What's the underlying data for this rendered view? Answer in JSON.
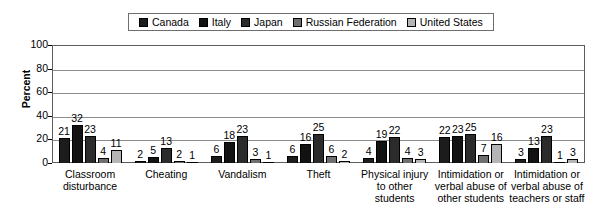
{
  "legend": {
    "entries": [
      {
        "label": "Canada",
        "color": "#1c1c1c",
        "swatch_name": "legend-swatch-canada"
      },
      {
        "label": "Italy",
        "color": "#121212",
        "swatch_name": "legend-swatch-italy"
      },
      {
        "label": "Japan",
        "color": "#2b2b2b",
        "swatch_name": "legend-swatch-japan"
      },
      {
        "label": "Russian Federation",
        "color": "#6f6f6f",
        "swatch_name": "legend-swatch-russian-federation"
      },
      {
        "label": "United States",
        "color": "#b5b5b5",
        "swatch_name": "legend-swatch-united-states"
      }
    ]
  },
  "axis": {
    "ylabel": "Percent",
    "yticks": [
      "100",
      "80",
      "60",
      "40",
      "20",
      "0"
    ]
  },
  "chart_data": {
    "type": "bar",
    "title": "",
    "xlabel": "",
    "ylabel": "Percent",
    "ylim": [
      0,
      100
    ],
    "yticks": [
      0,
      20,
      40,
      60,
      80,
      100
    ],
    "grid": true,
    "legend_position": "top-center",
    "categories": [
      "Classroom disturbance",
      "Cheating",
      "Vandalism",
      "Theft",
      "Physical injury to other students",
      "Intimidation or verbal abuse of other students",
      "Intimidation or verbal abuse of teachers or staff"
    ],
    "category_lines": [
      [
        "Classroom",
        "disturbance"
      ],
      [
        "Cheating"
      ],
      [
        "Vandalism"
      ],
      [
        "Theft"
      ],
      [
        "Physical injury",
        "to other",
        "students"
      ],
      [
        "Intimidation or",
        "verbal abuse of",
        "other students"
      ],
      [
        "Intimidation or",
        "verbal abuse of",
        "teachers or staff"
      ]
    ],
    "series": [
      {
        "name": "Canada",
        "color": "#1c1c1c",
        "values": [
          21,
          2,
          6,
          6,
          4,
          22,
          3
        ]
      },
      {
        "name": "Italy",
        "color": "#121212",
        "values": [
          32,
          5,
          18,
          16,
          19,
          23,
          13
        ]
      },
      {
        "name": "Japan",
        "color": "#2b2b2b",
        "values": [
          23,
          13,
          23,
          25,
          22,
          25,
          23
        ]
      },
      {
        "name": "Russian Federation",
        "color": "#6f6f6f",
        "values": [
          4,
          2,
          3,
          6,
          4,
          7,
          1
        ]
      },
      {
        "name": "United States",
        "color": "#b5b5b5",
        "values": [
          11,
          1,
          1,
          2,
          3,
          16,
          3
        ]
      }
    ]
  }
}
